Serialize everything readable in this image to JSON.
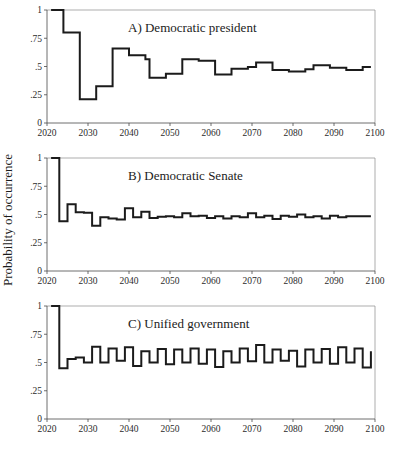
{
  "figure": {
    "ylabel": "Probability of occurrence",
    "background": "#ffffff",
    "line_color": "#1b1b1b",
    "axis_color": "#4a4a4a"
  },
  "chart_data": [
    {
      "type": "line",
      "title": "A) Democratic president",
      "xlabel": "",
      "ylabel": "Probability of occurrence",
      "xlim": [
        2020,
        2100
      ],
      "ylim": [
        0,
        1
      ],
      "xticks": [
        2020,
        2030,
        2040,
        2050,
        2060,
        2070,
        2080,
        2090,
        2100
      ],
      "xticklabels": [
        "2020",
        "2030",
        "2040",
        "2050",
        "2060",
        "2070",
        "2080",
        "2090",
        "2100"
      ],
      "yticks": [
        0,
        0.25,
        0.5,
        0.75,
        1
      ],
      "yticklabels": [
        "0",
        ".25",
        ".5",
        ".75",
        "1"
      ],
      "grid": false,
      "legend": "none",
      "x": [
        2021,
        2022,
        2023,
        2024,
        2025,
        2026,
        2027,
        2028,
        2029,
        2030,
        2031,
        2032,
        2033,
        2034,
        2035,
        2036,
        2037,
        2038,
        2039,
        2040,
        2041,
        2042,
        2043,
        2044,
        2045,
        2046,
        2047,
        2048,
        2049,
        2050,
        2051,
        2052,
        2053,
        2054,
        2055,
        2056,
        2057,
        2058,
        2059,
        2060,
        2061,
        2062,
        2063,
        2064,
        2065,
        2066,
        2067,
        2068,
        2069,
        2070,
        2071,
        2072,
        2073,
        2074,
        2075,
        2076,
        2077,
        2078,
        2079,
        2080,
        2081,
        2082,
        2083,
        2084,
        2085,
        2086,
        2087,
        2088,
        2089,
        2090,
        2091,
        2092,
        2093,
        2094,
        2095,
        2096,
        2097,
        2098,
        2099
      ],
      "values": [
        1.0,
        1.0,
        1.0,
        0.8,
        0.8,
        0.8,
        0.8,
        0.21,
        0.21,
        0.21,
        0.21,
        0.325,
        0.325,
        0.325,
        0.325,
        0.66,
        0.66,
        0.66,
        0.66,
        0.6,
        0.6,
        0.6,
        0.6,
        0.565,
        0.4,
        0.4,
        0.4,
        0.4,
        0.435,
        0.435,
        0.435,
        0.435,
        0.565,
        0.565,
        0.565,
        0.565,
        0.55,
        0.55,
        0.55,
        0.55,
        0.43,
        0.43,
        0.43,
        0.43,
        0.48,
        0.48,
        0.48,
        0.48,
        0.495,
        0.495,
        0.535,
        0.535,
        0.535,
        0.535,
        0.47,
        0.47,
        0.47,
        0.47,
        0.455,
        0.455,
        0.455,
        0.455,
        0.475,
        0.475,
        0.51,
        0.51,
        0.51,
        0.51,
        0.49,
        0.49,
        0.49,
        0.49,
        0.47,
        0.47,
        0.47,
        0.47,
        0.495,
        0.495,
        0.495
      ]
    },
    {
      "type": "line",
      "title": "B) Democratic Senate",
      "xlabel": "",
      "ylabel": "Probability of occurrence",
      "xlim": [
        2020,
        2100
      ],
      "ylim": [
        0,
        1
      ],
      "xticks": [
        2020,
        2030,
        2040,
        2050,
        2060,
        2070,
        2080,
        2090,
        2100
      ],
      "xticklabels": [
        "2020",
        "2030",
        "2040",
        "2050",
        "2060",
        "2070",
        "2080",
        "2090",
        "2100"
      ],
      "yticks": [
        0,
        0.25,
        0.5,
        0.75,
        1
      ],
      "yticklabels": [
        "0",
        ".25",
        ".5",
        ".75",
        "1"
      ],
      "grid": false,
      "legend": "none",
      "x": [
        2021,
        2022,
        2023,
        2024,
        2025,
        2026,
        2027,
        2028,
        2029,
        2030,
        2031,
        2032,
        2033,
        2034,
        2035,
        2036,
        2037,
        2038,
        2039,
        2040,
        2041,
        2042,
        2043,
        2044,
        2045,
        2046,
        2047,
        2048,
        2049,
        2050,
        2051,
        2052,
        2053,
        2054,
        2055,
        2056,
        2057,
        2058,
        2059,
        2060,
        2061,
        2062,
        2063,
        2064,
        2065,
        2066,
        2067,
        2068,
        2069,
        2070,
        2071,
        2072,
        2073,
        2074,
        2075,
        2076,
        2077,
        2078,
        2079,
        2080,
        2081,
        2082,
        2083,
        2084,
        2085,
        2086,
        2087,
        2088,
        2089,
        2090,
        2091,
        2092,
        2093,
        2094,
        2095,
        2096,
        2097,
        2098,
        2099
      ],
      "values": [
        1.0,
        1.0,
        0.44,
        0.44,
        0.59,
        0.59,
        0.52,
        0.52,
        0.515,
        0.515,
        0.4,
        0.4,
        0.475,
        0.475,
        0.465,
        0.465,
        0.455,
        0.455,
        0.555,
        0.555,
        0.475,
        0.475,
        0.525,
        0.525,
        0.47,
        0.47,
        0.48,
        0.48,
        0.485,
        0.485,
        0.475,
        0.475,
        0.51,
        0.51,
        0.485,
        0.485,
        0.49,
        0.49,
        0.47,
        0.47,
        0.485,
        0.485,
        0.465,
        0.465,
        0.485,
        0.485,
        0.475,
        0.475,
        0.51,
        0.51,
        0.475,
        0.475,
        0.49,
        0.49,
        0.46,
        0.46,
        0.49,
        0.49,
        0.48,
        0.48,
        0.5,
        0.5,
        0.475,
        0.475,
        0.485,
        0.485,
        0.465,
        0.465,
        0.49,
        0.49,
        0.475,
        0.475,
        0.485,
        0.485,
        0.485,
        0.485,
        0.485,
        0.485,
        0.485
      ]
    },
    {
      "type": "line",
      "title": "C) Unified government",
      "xlabel": "",
      "ylabel": "Probability of occurrence",
      "xlim": [
        2020,
        2100
      ],
      "ylim": [
        0,
        1
      ],
      "xticks": [
        2020,
        2030,
        2040,
        2050,
        2060,
        2070,
        2080,
        2090,
        2100
      ],
      "xticklabels": [
        "2020",
        "2030",
        "2040",
        "2050",
        "2060",
        "2070",
        "2080",
        "2090",
        "2100"
      ],
      "yticks": [
        0,
        0.25,
        0.5,
        0.75,
        1
      ],
      "yticklabels": [
        "0",
        ".25",
        ".5",
        ".75",
        "1"
      ],
      "grid": false,
      "legend": "none",
      "x": [
        2021,
        2022,
        2023,
        2024,
        2025,
        2026,
        2027,
        2028,
        2029,
        2030,
        2031,
        2032,
        2033,
        2034,
        2035,
        2036,
        2037,
        2038,
        2039,
        2040,
        2041,
        2042,
        2043,
        2044,
        2045,
        2046,
        2047,
        2048,
        2049,
        2050,
        2051,
        2052,
        2053,
        2054,
        2055,
        2056,
        2057,
        2058,
        2059,
        2060,
        2061,
        2062,
        2063,
        2064,
        2065,
        2066,
        2067,
        2068,
        2069,
        2070,
        2071,
        2072,
        2073,
        2074,
        2075,
        2076,
        2077,
        2078,
        2079,
        2080,
        2081,
        2082,
        2083,
        2084,
        2085,
        2086,
        2087,
        2088,
        2089,
        2090,
        2091,
        2092,
        2093,
        2094,
        2095,
        2096,
        2097,
        2098,
        2099
      ],
      "values": [
        1.0,
        1.0,
        0.45,
        0.45,
        0.53,
        0.53,
        0.545,
        0.545,
        0.5,
        0.5,
        0.64,
        0.64,
        0.5,
        0.5,
        0.625,
        0.625,
        0.515,
        0.515,
        0.635,
        0.635,
        0.47,
        0.47,
        0.6,
        0.6,
        0.5,
        0.5,
        0.62,
        0.62,
        0.485,
        0.485,
        0.615,
        0.615,
        0.5,
        0.5,
        0.625,
        0.625,
        0.49,
        0.49,
        0.615,
        0.615,
        0.46,
        0.46,
        0.6,
        0.6,
        0.5,
        0.5,
        0.625,
        0.625,
        0.51,
        0.51,
        0.655,
        0.655,
        0.5,
        0.5,
        0.615,
        0.615,
        0.515,
        0.515,
        0.605,
        0.605,
        0.465,
        0.465,
        0.615,
        0.615,
        0.5,
        0.5,
        0.62,
        0.62,
        0.49,
        0.49,
        0.635,
        0.635,
        0.5,
        0.5,
        0.625,
        0.625,
        0.455,
        0.455,
        0.6
      ]
    }
  ]
}
